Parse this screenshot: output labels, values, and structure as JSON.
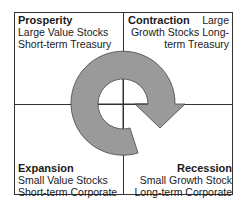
{
  "diagram": {
    "type": "business-cycle-quadrant",
    "arrow_color": "#9a9a9a",
    "arrow_direction": "clockwise",
    "quadrants": [
      {
        "position": "top-left",
        "title": "Prosperity",
        "line1": "Large Value Stocks",
        "line2": "Short-term Treasury"
      },
      {
        "position": "top-right",
        "title": "Contraction",
        "title_suffix": "Large",
        "line1": "Growth Stocks Long-",
        "line2": "term Treasury"
      },
      {
        "position": "bottom-left",
        "title": "Expansion",
        "line1": "Small Value Stocks",
        "line2": "Short-term Corporate"
      },
      {
        "position": "bottom-right",
        "title": "Recession",
        "line1": "Small Growth Stock",
        "line2": "Long-term Corporate"
      }
    ]
  }
}
